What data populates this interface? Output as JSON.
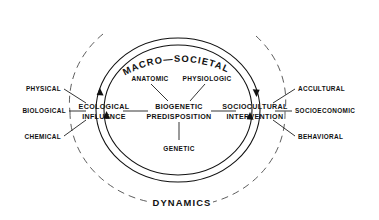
{
  "diagram": {
    "title_top": "MACRO—SOCIETAL",
    "title_bottom": "DYNAMICS",
    "nodes": {
      "left": {
        "line1": "ECOLOGICAL",
        "line2": "INFLUENCE"
      },
      "center": {
        "line1": "BIOGENETIC",
        "line2": "PREDISPOSITION"
      },
      "right": {
        "line1": "SOCIOCULTURAL",
        "line2": "INTERVENTION"
      }
    },
    "left_inputs": [
      {
        "label": "PHYSICAL"
      },
      {
        "label": "BIOLOGICAL"
      },
      {
        "label": "CHEMICAL"
      }
    ],
    "right_inputs": [
      {
        "label": "ACCULTURAL"
      },
      {
        "label": "SOCIOECONOMIC"
      },
      {
        "label": "BEHAVIORAL"
      }
    ],
    "center_top_inputs": [
      {
        "label": "ANATOMIC"
      },
      {
        "label": "PHYSIOLOGIC"
      }
    ],
    "center_bottom_inputs": [
      {
        "label": "GENETIC"
      }
    ],
    "icons": {
      "outer_ring": "dashed-circle-icon",
      "inner_ring_outer": "solid-circle-icon",
      "inner_ring_inner": "solid-circle-icon",
      "arrow_left_up": "arrow-up-icon",
      "arrow_left_up2": "arrow-up-icon",
      "arrow_right_down": "arrow-down-icon",
      "arrow_right_up": "arrow-up-icon"
    },
    "colors": {
      "ink": "#111111",
      "dashed": "#333333",
      "background": "#ffffff"
    }
  }
}
